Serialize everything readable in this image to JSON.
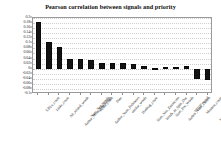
{
  "chart_data": {
    "type": "bar",
    "title": "Pearson correlation between signals and priority",
    "xlabel": "",
    "ylabel": "",
    "ylim": [
      -0.1,
      0.2
    ],
    "ytick_step": 0.02,
    "grid": true,
    "legend": "none",
    "bar_color": "#131313",
    "categories": [
      "URLs_count",
      "Links_count",
      "Alt_related_words",
      "Author_Mean_Followings",
      "Num_Neg_Words",
      "Media_count",
      "Author_Num_Followers",
      "Date",
      "similar_words",
      "Hashtag_count",
      "Num_Neu_Emoticons",
      "Words_in_Split_Doc",
      "Num_Pos_Words",
      "Author_Num_Tweets",
      "TFIDF_Word",
      "Mention_count",
      "Num_Pos_Emoticons"
    ],
    "values": [
      0.185,
      0.105,
      0.085,
      0.038,
      0.037,
      0.033,
      0.024,
      0.022,
      0.021,
      0.019,
      0.012,
      0.004,
      0.005,
      0.006,
      0.009,
      -0.042,
      -0.044
    ],
    "ytick_labels": [
      "0.2",
      "0.18",
      "0.16",
      "0.14",
      "0.12",
      "0.1",
      "0.08",
      "0.06",
      "0.04",
      "0.02",
      "0",
      "-0.02",
      "-0.04",
      "-0.06",
      "-0.08",
      "-0.1"
    ]
  }
}
